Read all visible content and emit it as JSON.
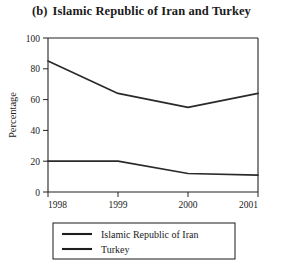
{
  "figure": {
    "panel_tag": "(b)",
    "title": "Islamic Republic of Iran and Turkey"
  },
  "chart_data": {
    "type": "line",
    "xlabel": "",
    "ylabel": "Percentage",
    "categories": [
      "1998",
      "1999",
      "2000",
      "2001"
    ],
    "x": [
      1998,
      1999,
      2000,
      2001
    ],
    "xlim": [
      1998,
      2001
    ],
    "ylim": [
      0,
      100
    ],
    "yticks": [
      0,
      20,
      40,
      60,
      80,
      100
    ],
    "ytick_labels": [
      "0",
      "20",
      "40",
      "60",
      "80",
      "100"
    ],
    "xticks": [
      1998,
      1999,
      2000,
      2001
    ],
    "xtick_labels": [
      "1998",
      "1999",
      "2000",
      "2001"
    ],
    "grid": false,
    "legend_position": "below",
    "series": [
      {
        "name": "Islamic Republic of Iran",
        "color": "#2a2a2a",
        "values": [
          20,
          20,
          12,
          11
        ]
      },
      {
        "name": "Turkey",
        "color": "#2a2a2a",
        "values": [
          85,
          64,
          55,
          64
        ]
      }
    ]
  },
  "axes": {
    "y_title": "Percentage",
    "y_ticks": [
      "100",
      "80",
      "60",
      "40",
      "20",
      "0"
    ],
    "x_ticks": [
      "1998",
      "1999",
      "2000",
      "2001"
    ]
  },
  "legend": {
    "entries": [
      {
        "label": "Islamic Republic of Iran"
      },
      {
        "label": "Turkey"
      }
    ]
  }
}
